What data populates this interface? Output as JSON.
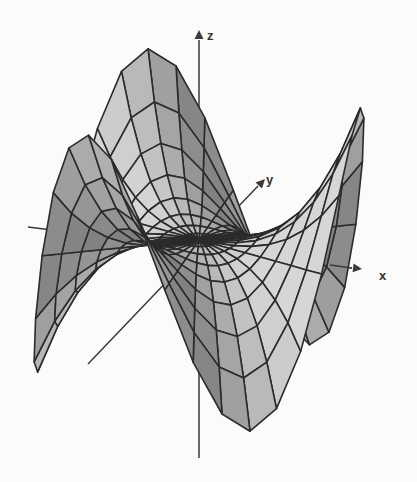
{
  "chart_data": {
    "type": "surface3d",
    "title": "",
    "surface": {
      "name": "monkey-saddle",
      "function": "z = x^3 - 3*x*y^2",
      "domain": "polar disk, r in [0, 1], theta in [0, 2pi]",
      "r_range": [
        0,
        1
      ],
      "radial_divisions": 8,
      "angular_divisions": 36,
      "z_scale": 1.0
    },
    "axes": {
      "x": {
        "label": "x",
        "ticks": []
      },
      "y": {
        "label": "y",
        "ticks": []
      },
      "z": {
        "label": "z",
        "ticks": []
      }
    },
    "view": {
      "azimuth_deg": -12,
      "elevation_deg": 18
    },
    "colors": {
      "mesh_line": "#2b2b2b",
      "face_light": "#d6d6d6",
      "face_dark": "#6e6e6e",
      "axis": "#3a3a3a",
      "background": "#fbfbfa"
    },
    "grid": false,
    "legend": "none"
  }
}
